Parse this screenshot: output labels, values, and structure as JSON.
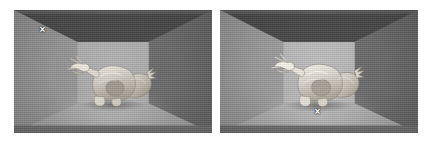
{
  "figure": {
    "caption": "",
    "panel_count": 2,
    "background_color": "#ffffff"
  },
  "palette": {
    "ceiling": "#474747",
    "ceiling_band": "#5c5c5c",
    "wall_left": "#9e9e9e",
    "wall_right": "#757575",
    "wall_back": "#a6a6a6",
    "floor": "#9a9a9a",
    "floor_lip": "#6f6f6f",
    "statue": "#d8d4cc",
    "marker": "#ffffff"
  },
  "panels": [
    {
      "id": "panel-left",
      "name": "left-render",
      "label": "",
      "lighting": "dim",
      "scene": {
        "room_type": "cornell-box",
        "object": "dragon-statue",
        "surfaces": [
          "ceiling",
          "left-wall",
          "right-wall",
          "back-wall",
          "floor"
        ]
      },
      "marker": {
        "glyph": "×",
        "label": "x-marker",
        "position": {
          "x": 42,
          "y": 31
        },
        "placement": "upper-left ceiling-wall edge",
        "color": "#ffffff"
      }
    },
    {
      "id": "panel-right",
      "name": "right-render",
      "label": "",
      "lighting": "bright",
      "scene": {
        "room_type": "cornell-box",
        "object": "dragon-statue",
        "surfaces": [
          "ceiling",
          "left-wall",
          "right-wall",
          "back-wall",
          "floor"
        ]
      },
      "marker": {
        "glyph": "×",
        "label": "x-marker",
        "position": {
          "x": 317,
          "y": 113
        },
        "placement": "floor below statue",
        "color": "#ffffff"
      }
    }
  ]
}
